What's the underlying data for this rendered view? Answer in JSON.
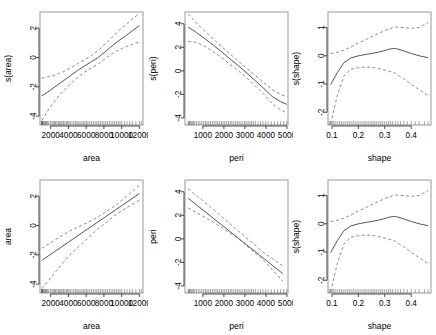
{
  "figure": {
    "title": "",
    "layout": "2 rows x 3 columns of partial effect plots",
    "background": "#ffffff",
    "line_color": "#555555",
    "ci_color": "#777777",
    "box_color": "#808080"
  },
  "chart_data": [
    {
      "id": "panel-r1c1",
      "type": "line",
      "title": "",
      "xlabel": "area",
      "ylabel": "s(area)",
      "xlim": [
        800,
        12400
      ],
      "ylim": [
        -4.6,
        3.1
      ],
      "xticks": [
        2000,
        4000,
        6000,
        8000,
        10000,
        12000
      ],
      "xticklabels": [
        "2000",
        "4000",
        "6000",
        "8000",
        "10000",
        "12000"
      ],
      "yticks": [
        -4,
        -2,
        0,
        2
      ],
      "yticklabels": [
        "-4",
        "-2",
        "0",
        "2"
      ],
      "grid": false,
      "legend": "none",
      "rug": true,
      "series": [
        {
          "name": "fit",
          "style": "solid",
          "x": [
            1000,
            1800,
            2600,
            3400,
            4200,
            5000,
            5800,
            6600,
            7400,
            8200,
            8800,
            9600,
            10400,
            11200,
            12000
          ],
          "y": [
            -2.62,
            -2.3,
            -1.95,
            -1.6,
            -1.25,
            -0.9,
            -0.58,
            -0.28,
            0.02,
            0.42,
            0.72,
            1.12,
            1.45,
            1.82,
            2.18
          ]
        },
        {
          "name": "upper-ci",
          "style": "dashed",
          "x": [
            1000,
            1800,
            2600,
            3400,
            4200,
            5000,
            5800,
            6600,
            7400,
            8200,
            8800,
            9600,
            10400,
            11200,
            12000
          ],
          "y": [
            -1.42,
            -1.3,
            -1.18,
            -0.98,
            -0.72,
            -0.44,
            -0.16,
            0.14,
            0.5,
            0.95,
            1.3,
            1.8,
            2.2,
            2.62,
            3.0
          ]
        },
        {
          "name": "lower-ci",
          "style": "dashed",
          "x": [
            1000,
            1800,
            2600,
            3400,
            4200,
            5000,
            5800,
            6600,
            7400,
            8200,
            8800,
            9600,
            10400,
            11200,
            12000
          ],
          "y": [
            -4.3,
            -3.5,
            -2.85,
            -2.3,
            -1.8,
            -1.38,
            -1.0,
            -0.7,
            -0.42,
            -0.05,
            0.2,
            0.5,
            0.72,
            0.9,
            1.05
          ]
        }
      ]
    },
    {
      "id": "panel-r1c2",
      "type": "line",
      "title": "",
      "xlabel": "peri",
      "ylabel": "s(peri)",
      "xlim": [
        150,
        5050
      ],
      "ylim": [
        -4.6,
        5.0
      ],
      "xticks": [
        1000,
        2000,
        3000,
        4000,
        5000
      ],
      "xticklabels": [
        "1000",
        "2000",
        "3000",
        "4000",
        "5000"
      ],
      "yticks": [
        -4,
        -2,
        0,
        2,
        4
      ],
      "yticklabels": [
        "-4",
        "-2",
        "0",
        "2",
        "4"
      ],
      "grid": false,
      "legend": "none",
      "rug": true,
      "series": [
        {
          "name": "fit",
          "style": "solid",
          "x": [
            300,
            700,
            1100,
            1500,
            1900,
            2300,
            2700,
            3100,
            3500,
            3900,
            4300,
            4700,
            5000
          ],
          "y": [
            3.72,
            3.25,
            2.72,
            2.18,
            1.6,
            1.0,
            0.42,
            -0.2,
            -0.85,
            -1.5,
            -2.18,
            -2.62,
            -2.85
          ]
        },
        {
          "name": "upper-ci",
          "style": "dashed",
          "x": [
            300,
            700,
            1100,
            1500,
            1900,
            2300,
            2700,
            3100,
            3500,
            3900,
            4300,
            4700,
            5000
          ],
          "y": [
            4.85,
            4.05,
            3.35,
            2.7,
            2.05,
            1.42,
            0.82,
            0.2,
            -0.4,
            -1.0,
            -1.6,
            -2.0,
            -2.2
          ]
        },
        {
          "name": "lower-ci",
          "style": "dashed",
          "x": [
            300,
            700,
            1100,
            1500,
            1900,
            2300,
            2700,
            3100,
            3500,
            3900,
            4300,
            4700,
            5000
          ],
          "y": [
            2.5,
            2.42,
            2.08,
            1.62,
            1.12,
            0.55,
            -0.02,
            -0.62,
            -1.28,
            -2.0,
            -2.78,
            -3.3,
            -3.6
          ]
        }
      ]
    },
    {
      "id": "panel-r1c3",
      "type": "line",
      "title": "",
      "xlabel": "shape",
      "ylabel": "s(shape)",
      "xlim": [
        0.085,
        0.475
      ],
      "ylim": [
        -2.45,
        1.55
      ],
      "xticks": [
        0.1,
        0.2,
        0.3,
        0.4
      ],
      "xticklabels": [
        "0.1",
        "0.2",
        "0.3",
        "0.4"
      ],
      "yticks": [
        -2,
        -1,
        0,
        1
      ],
      "yticklabels": [
        "-2",
        "-1",
        "0",
        "1"
      ],
      "grid": false,
      "legend": "none",
      "rug": true,
      "series": [
        {
          "name": "fit",
          "style": "solid",
          "x": [
            0.095,
            0.12,
            0.145,
            0.17,
            0.2,
            0.23,
            0.26,
            0.29,
            0.32,
            0.34,
            0.37,
            0.4,
            0.43,
            0.465
          ],
          "y": [
            -1.02,
            -0.6,
            -0.25,
            -0.08,
            0.0,
            0.05,
            0.1,
            0.16,
            0.24,
            0.26,
            0.18,
            0.08,
            0.0,
            -0.07
          ]
        },
        {
          "name": "upper-ci",
          "style": "dashed",
          "x": [
            0.095,
            0.12,
            0.145,
            0.17,
            0.2,
            0.23,
            0.26,
            0.29,
            0.32,
            0.34,
            0.37,
            0.4,
            0.43,
            0.465
          ],
          "y": [
            0.08,
            0.12,
            0.2,
            0.3,
            0.45,
            0.58,
            0.72,
            0.85,
            0.97,
            1.02,
            1.0,
            0.97,
            1.0,
            1.18
          ]
        },
        {
          "name": "lower-ci",
          "style": "dashed",
          "x": [
            0.095,
            0.12,
            0.145,
            0.17,
            0.2,
            0.23,
            0.26,
            0.29,
            0.32,
            0.34,
            0.37,
            0.4,
            0.43,
            0.465
          ],
          "y": [
            -2.4,
            -1.42,
            -0.72,
            -0.48,
            -0.42,
            -0.4,
            -0.42,
            -0.48,
            -0.56,
            -0.62,
            -0.8,
            -1.0,
            -1.2,
            -1.42
          ]
        }
      ]
    },
    {
      "id": "panel-r2c1",
      "type": "line",
      "title": "",
      "xlabel": "area",
      "ylabel": "area",
      "xlim": [
        800,
        12400
      ],
      "ylim": [
        -4.6,
        3.1
      ],
      "xticks": [
        2000,
        4000,
        6000,
        8000,
        10000,
        12000
      ],
      "xticklabels": [
        "2000",
        "4000",
        "6000",
        "8000",
        "10000",
        "12000"
      ],
      "yticks": [
        -4,
        -2,
        0,
        2
      ],
      "yticklabels": [
        "-4",
        "-2",
        "0",
        "2"
      ],
      "grid": false,
      "legend": "none",
      "rug": true,
      "series": [
        {
          "name": "fit",
          "style": "solid",
          "x": [
            1000,
            12000
          ],
          "y": [
            -2.38,
            2.18
          ]
        },
        {
          "name": "upper-ci",
          "style": "dashed",
          "x": [
            1000,
            4000,
            7000,
            9500,
            12000
          ],
          "y": [
            -1.55,
            -0.42,
            0.45,
            1.45,
            2.75
          ]
        },
        {
          "name": "lower-ci",
          "style": "dashed",
          "x": [
            1000,
            4000,
            7000,
            9500,
            12000
          ],
          "y": [
            -4.3,
            -2.1,
            -0.4,
            0.82,
            1.72
          ]
        }
      ]
    },
    {
      "id": "panel-r2c2",
      "type": "line",
      "title": "",
      "xlabel": "peri",
      "ylabel": "peri",
      "xlim": [
        150,
        5050
      ],
      "ylim": [
        -4.6,
        5.0
      ],
      "xticks": [
        1000,
        2000,
        3000,
        4000,
        5000
      ],
      "xticklabels": [
        "1000",
        "2000",
        "3000",
        "4000",
        "5000"
      ],
      "yticks": [
        -4,
        -2,
        0,
        2,
        4
      ],
      "yticklabels": [
        "-4",
        "-2",
        "0",
        "2",
        "4"
      ],
      "grid": false,
      "legend": "none",
      "rug": true,
      "series": [
        {
          "name": "fit",
          "style": "solid",
          "x": [
            300,
            4800
          ],
          "y": [
            3.45,
            -2.95
          ]
        },
        {
          "name": "upper-ci",
          "style": "dashed",
          "x": [
            300,
            1500,
            2700,
            3900,
            4800
          ],
          "y": [
            4.25,
            2.5,
            0.65,
            -1.18,
            -2.3
          ]
        },
        {
          "name": "lower-ci",
          "style": "dashed",
          "x": [
            300,
            1500,
            2700,
            3900,
            4800
          ],
          "y": [
            2.62,
            1.42,
            0.0,
            -1.85,
            -3.58
          ]
        }
      ]
    },
    {
      "id": "panel-r2c3",
      "type": "line",
      "title": "",
      "xlabel": "shape",
      "ylabel": "s(shape)",
      "xlim": [
        0.085,
        0.475
      ],
      "ylim": [
        -2.45,
        1.55
      ],
      "xticks": [
        0.1,
        0.2,
        0.3,
        0.4
      ],
      "xticklabels": [
        "0.1",
        "0.2",
        "0.3",
        "0.4"
      ],
      "yticks": [
        -2,
        -1,
        0,
        1
      ],
      "yticklabels": [
        "-2",
        "-1",
        "0",
        "1"
      ],
      "grid": false,
      "legend": "none",
      "rug": true,
      "series": [
        {
          "name": "fit",
          "style": "solid",
          "x": [
            0.095,
            0.12,
            0.145,
            0.17,
            0.2,
            0.23,
            0.26,
            0.29,
            0.32,
            0.34,
            0.37,
            0.4,
            0.43,
            0.465
          ],
          "y": [
            -1.02,
            -0.6,
            -0.25,
            -0.08,
            0.0,
            0.05,
            0.1,
            0.16,
            0.24,
            0.26,
            0.18,
            0.08,
            0.0,
            -0.07
          ]
        },
        {
          "name": "upper-ci",
          "style": "dashed",
          "x": [
            0.095,
            0.12,
            0.145,
            0.17,
            0.2,
            0.23,
            0.26,
            0.29,
            0.32,
            0.34,
            0.37,
            0.4,
            0.43,
            0.465
          ],
          "y": [
            0.08,
            0.12,
            0.2,
            0.3,
            0.45,
            0.58,
            0.72,
            0.85,
            0.97,
            1.02,
            1.0,
            0.97,
            1.0,
            1.18
          ]
        },
        {
          "name": "lower-ci",
          "style": "dashed",
          "x": [
            0.095,
            0.12,
            0.145,
            0.17,
            0.2,
            0.23,
            0.26,
            0.29,
            0.32,
            0.34,
            0.37,
            0.4,
            0.43,
            0.465
          ],
          "y": [
            -2.4,
            -1.42,
            -0.72,
            -0.48,
            -0.42,
            -0.4,
            -0.42,
            -0.48,
            -0.56,
            -0.62,
            -0.8,
            -1.0,
            -1.2,
            -1.42
          ]
        }
      ]
    }
  ],
  "rug_values": {
    "area": [
      1016,
      1020,
      1024,
      1031,
      1038,
      1050,
      1060,
      1090,
      1110,
      1170,
      1260,
      1360,
      1420,
      1530,
      1650,
      1800,
      1990,
      2150,
      2300,
      2450,
      2560,
      2700,
      2880,
      3020,
      3150,
      3290,
      3450,
      3600,
      3780,
      3920,
      4050,
      4200,
      4400,
      4600,
      4800,
      4960,
      5100,
      5300,
      5500,
      5680,
      5850,
      6030,
      6200,
      6400,
      6600,
      6800,
      7000,
      7200,
      7400,
      7600,
      7800,
      8000,
      8200,
      8400,
      8600,
      8800,
      9000,
      9200,
      9400,
      9600,
      9800,
      10000,
      10300,
      10600,
      10900,
      11200,
      11600,
      12000,
      12212
    ],
    "peri": [
      308,
      330,
      365,
      400,
      450,
      500,
      560,
      620,
      700,
      780,
      860,
      950,
      1040,
      1120,
      1200,
      1280,
      1360,
      1450,
      1530,
      1620,
      1700,
      1790,
      1880,
      1960,
      2040,
      2130,
      2220,
      2300,
      2380,
      2470,
      2560,
      2640,
      2720,
      2810,
      2900,
      2980,
      3060,
      3150,
      3240,
      3320,
      3400,
      3500,
      3620,
      3740,
      3860,
      3980,
      4100,
      4250,
      4400,
      4550,
      4700,
      4850,
      4990
    ],
    "shape": [
      0.09,
      0.095,
      0.1,
      0.105,
      0.112,
      0.12,
      0.128,
      0.135,
      0.142,
      0.15,
      0.158,
      0.165,
      0.172,
      0.18,
      0.188,
      0.195,
      0.202,
      0.21,
      0.218,
      0.225,
      0.232,
      0.24,
      0.248,
      0.255,
      0.262,
      0.27,
      0.278,
      0.285,
      0.292,
      0.3,
      0.308,
      0.315,
      0.322,
      0.33,
      0.34,
      0.35,
      0.36,
      0.372,
      0.385,
      0.4,
      0.415,
      0.43,
      0.45,
      0.464
    ]
  }
}
